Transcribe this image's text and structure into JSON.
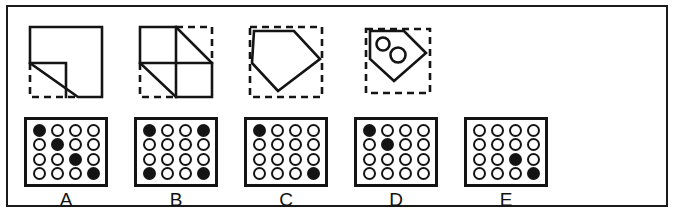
{
  "figure": {
    "title": "",
    "border_color": "#1a1a1a",
    "background": "#ffffff",
    "ink_color": "#141414",
    "options": [
      "A",
      "B",
      "C",
      "D",
      "E"
    ],
    "shape_count": 4,
    "grid_count": 5
  },
  "shapes": [
    {
      "id": "A",
      "name": "square-with-lower-left-notch",
      "description": "Solid square outline with a right triangle notch removed from the lower-left corner; the removed triangle is outlined with dashed lines",
      "solid_outline": "square with stepped/diagonal lower-left cut",
      "dashed_outline": "left and bottom edges of the missing corner triangle",
      "inner_lines": [
        "diagonal from mid-left to bottom-center",
        "horizontal from mid-left to mid-center",
        "vertical from mid-center down to bottom"
      ]
    },
    {
      "id": "B",
      "name": "quartered-square-two-diagonals",
      "description": "Square divided into four quadrants; the top-right and bottom-left quadrants are cut by diagonals, with dashed lines completing the missing triangular regions",
      "solid_outline": "square body with two diagonal cuts",
      "dashed_outline": "top-right corner and bottom-left corner triangles",
      "inner_lines": [
        "vertical center divider",
        "horizontal center divider",
        "diagonal top-right quadrant",
        "diagonal bottom-left quadrant"
      ]
    },
    {
      "id": "C",
      "name": "pentagon-arrow-shape",
      "description": "Pentagon / home-plate shape pointing right, enclosed in a dashed square that marks the removed area",
      "solid_outline": "pentagon with a point on the right side and a point at the bottom",
      "dashed_outline": "full square bounding box",
      "inner_lines": []
    },
    {
      "id": "D",
      "name": "pentagon-arrow-shape-with-two-circles",
      "description": "Smaller pentagon / home-plate shape pointing right containing two small circles, enclosed in a dashed square",
      "solid_outline": "pentagon with a point on the right side and a point at the bottom",
      "dashed_outline": "full square bounding box",
      "inner_lines": [],
      "inner_circles": 2
    }
  ],
  "grids": [
    {
      "id": "A",
      "label": "A",
      "rows": 4,
      "cols": 4,
      "filled_cells": [
        [
          0,
          0
        ],
        [
          1,
          1
        ],
        [
          2,
          2
        ],
        [
          3,
          3
        ]
      ],
      "pattern": "main diagonal top-left to bottom-right"
    },
    {
      "id": "B",
      "label": "B",
      "rows": 4,
      "cols": 4,
      "filled_cells": [
        [
          0,
          0
        ],
        [
          0,
          3
        ],
        [
          3,
          0
        ],
        [
          3,
          3
        ]
      ],
      "pattern": "four corners"
    },
    {
      "id": "C",
      "label": "C",
      "rows": 4,
      "cols": 4,
      "filled_cells": [
        [
          0,
          0
        ],
        [
          3,
          3
        ]
      ],
      "pattern": "top-left and bottom-right corners"
    },
    {
      "id": "D",
      "label": "D",
      "rows": 4,
      "cols": 4,
      "filled_cells": [
        [
          0,
          0
        ],
        [
          1,
          1
        ]
      ],
      "pattern": "first two cells of the main diagonal"
    },
    {
      "id": "E",
      "label": "E",
      "rows": 4,
      "cols": 4,
      "filled_cells": [
        [
          2,
          2
        ],
        [
          3,
          3
        ]
      ],
      "pattern": "last two cells of the main diagonal"
    }
  ],
  "labels": {
    "a": "A",
    "b": "B",
    "c": "C",
    "d": "D",
    "e": "E"
  }
}
